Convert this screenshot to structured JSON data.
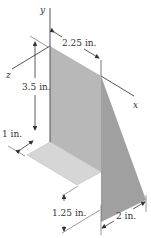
{
  "figure": {
    "axes": {
      "y": "y",
      "x": "x",
      "z": "z"
    },
    "dimensions": {
      "top_width": "2.25 in.",
      "height": "3.5 in.",
      "floor_depth": "1 in.",
      "floor_offset": "1.25 in.",
      "base_width": "2 in."
    },
    "colors": {
      "back_plate": "#b4b4b4",
      "triangle_plate": "#9e9e9e",
      "floor_plate": "#d4d4d4",
      "lines": "#333333"
    }
  }
}
